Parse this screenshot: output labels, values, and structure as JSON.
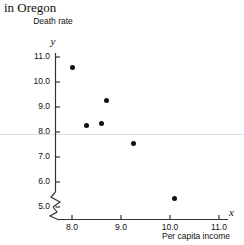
{
  "caption": {
    "fragment": "in Oregon"
  },
  "chart_data": {
    "type": "scatter",
    "title": "in Oregon",
    "xlabel": "Per capita income",
    "ylabel": "Death rate",
    "x_var_symbol": "x",
    "y_var_symbol": "y",
    "xlim": [
      7.6,
      11.4
    ],
    "ylim": [
      4.6,
      11.3
    ],
    "grid": false,
    "legend": false,
    "axis_break_x": true,
    "axis_break_y": true,
    "xticks": [
      "8.0",
      "9.0",
      "10.0",
      "11.0"
    ],
    "xtick_values": [
      8.0,
      9.0,
      10.0,
      11.0
    ],
    "yticks": [
      "5.0",
      "6.0",
      "7.0",
      "8.0",
      "9.0",
      "10.0",
      "11.0"
    ],
    "ytick_values": [
      5.0,
      6.0,
      7.0,
      8.0,
      9.0,
      10.0,
      11.0
    ],
    "points": [
      {
        "x": 8.0,
        "y": 10.6
      },
      {
        "x": 8.3,
        "y": 8.25
      },
      {
        "x": 8.6,
        "y": 8.35
      },
      {
        "x": 8.7,
        "y": 9.25
      },
      {
        "x": 9.25,
        "y": 7.55
      },
      {
        "x": 10.1,
        "y": 5.35
      }
    ],
    "marker": {
      "shape": "circle",
      "color": "#111111",
      "size": 5
    },
    "axis_color": "#333333"
  }
}
